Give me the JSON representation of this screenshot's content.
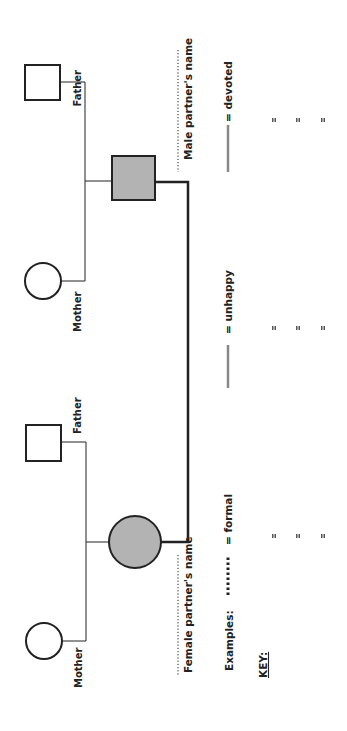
{
  "diagram": {
    "type": "genogram-relationship-template",
    "orientation": "rotated-90-ccw",
    "male_side": {
      "father_label": "Father",
      "mother_label": "Mother",
      "partner_label": "Male partner's name"
    },
    "female_side": {
      "father_label": "Father",
      "mother_label": "Mother",
      "partner_label": "Female partner's name"
    },
    "colors": {
      "line": "#222222",
      "shaded_fill": "#b3b3b3",
      "legend_gray": "#888888"
    }
  },
  "key": {
    "title": "KEY:",
    "examples_label": "Examples:",
    "items": [
      {
        "style": "dotted",
        "label": "= formal"
      },
      {
        "style": "solid-gray",
        "label": "= unhappy"
      },
      {
        "style": "solid-gray",
        "label": "= devoted"
      }
    ],
    "blank_entries_marker": "="
  }
}
